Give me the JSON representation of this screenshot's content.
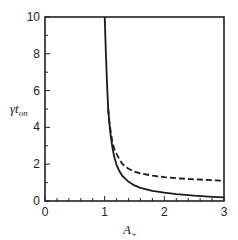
{
  "chart_data": {
    "type": "line",
    "title": "",
    "xlabel": "A+",
    "xlabel_main": "A",
    "xlabel_sub": "+",
    "ylabel": "γt_on",
    "ylabel_main": "γt",
    "ylabel_sub": "on",
    "xlim": [
      0,
      3
    ],
    "ylim": [
      0,
      10
    ],
    "xticks": [
      0,
      1,
      2,
      3
    ],
    "yticks": [
      0,
      2,
      4,
      6,
      8,
      10
    ],
    "x_minor_step": 0.2,
    "y_minor_step": 1,
    "grid": false,
    "legend": null,
    "series": [
      {
        "name": "solid",
        "style": "solid",
        "color": "#1a1a1a",
        "x": [
          1.0,
          1.02,
          1.04,
          1.06,
          1.08,
          1.1,
          1.13,
          1.16,
          1.2,
          1.25,
          1.3,
          1.4,
          1.5,
          1.6,
          1.8,
          2.0,
          2.2,
          2.5,
          2.8,
          3.0
        ],
        "y": [
          10.0,
          8.0,
          6.3,
          5.0,
          4.2,
          3.6,
          2.9,
          2.4,
          1.95,
          1.6,
          1.35,
          1.05,
          0.85,
          0.72,
          0.55,
          0.45,
          0.37,
          0.29,
          0.23,
          0.2
        ]
      },
      {
        "name": "dashed",
        "style": "dashed",
        "color": "#1a1a1a",
        "x": [
          1.06,
          1.08,
          1.1,
          1.13,
          1.16,
          1.2,
          1.25,
          1.3,
          1.4,
          1.5,
          1.6,
          1.8,
          2.0,
          2.2,
          2.5,
          2.8,
          3.0
        ],
        "y": [
          5.0,
          4.3,
          3.8,
          3.2,
          2.85,
          2.55,
          2.25,
          2.0,
          1.75,
          1.6,
          1.5,
          1.38,
          1.3,
          1.24,
          1.18,
          1.13,
          1.1
        ]
      }
    ]
  }
}
